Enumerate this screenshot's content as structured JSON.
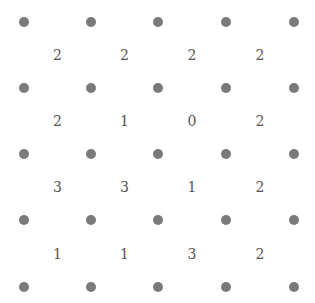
{
  "puzzle": {
    "type": "slitherlink",
    "rows": 4,
    "cols": 4,
    "clues": [
      [
        "2",
        "2",
        "2",
        "2"
      ],
      [
        "2",
        "1",
        "0",
        "2"
      ],
      [
        "3",
        "3",
        "1",
        "2"
      ],
      [
        "1",
        "1",
        "3",
        "2"
      ]
    ]
  },
  "layout": {
    "dot_x": [
      24,
      91,
      158,
      226,
      294
    ],
    "dot_y": [
      22,
      88,
      154,
      220,
      287
    ]
  },
  "colors": {
    "dot": "#7a7a7a",
    "clue_text": "#555555",
    "background": "#ffffff"
  }
}
